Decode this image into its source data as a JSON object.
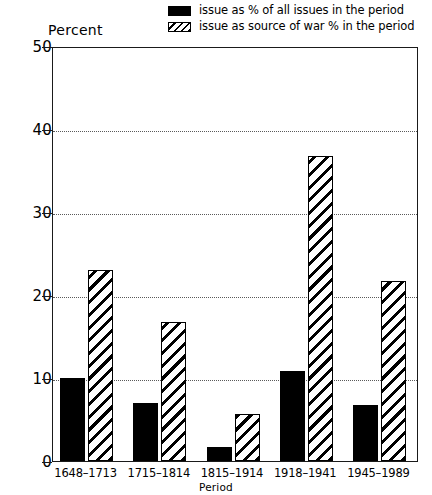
{
  "chart_data": {
    "type": "bar",
    "title": "",
    "xlabel": "Period",
    "ylabel": "Percent",
    "categories": [
      "1648–1713",
      "1715–1814",
      "1815–1914",
      "1918–1941",
      "1945–1989"
    ],
    "series": [
      {
        "name": "issue as % of all issues in the period",
        "style": "solid-black",
        "values": [
          10.0,
          7.0,
          1.7,
          10.8,
          6.8
        ]
      },
      {
        "name": "issue as source of war % in the period",
        "style": "diagonal-hatch",
        "values": [
          23.0,
          16.7,
          5.7,
          36.7,
          21.7
        ]
      }
    ],
    "ylim": [
      0,
      50
    ],
    "yticks": [
      0,
      10,
      20,
      30,
      40,
      50
    ],
    "ytick_labels": [
      "0",
      "10",
      "20",
      "30",
      "40",
      "50"
    ],
    "grid": "horizontal-dotted",
    "legend_position": "top-right"
  },
  "legend": {
    "items": [
      {
        "label": "issue as % of all issues in the period",
        "swatch": "solid"
      },
      {
        "label": "issue as source of war % in the period",
        "swatch": "hatch"
      }
    ]
  },
  "axes": {
    "y_title": "Percent",
    "x_title": "Period"
  },
  "colors": {
    "series_solid": "#000000",
    "series_hatch_line": "#000000",
    "axis": "#1a1a1a",
    "grid": "#5a5a5a",
    "background": "#ffffff"
  }
}
